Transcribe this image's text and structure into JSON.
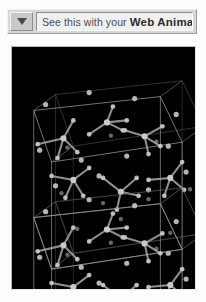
{
  "plugin_bar": {
    "menu_button": {
      "icon": "triangle-down-icon",
      "label": ""
    },
    "message_lead": "See this with your",
    "message_brand": "Web Animator"
  },
  "viewport": {
    "name": "molecule-viewport",
    "background_color": "#000000",
    "render_style": "ball-and-stick",
    "scene_description": "Crystal lattice of two stacked unit cells viewed in perspective, wireframe cell edges with branched tetrahedral molecules and isolated lattice atoms",
    "colors": {
      "atom": "#c9c9c9",
      "atom_dim": "#8a8a8a",
      "bond": "#a8a8a8",
      "cell_edge": "#9a9a9a",
      "cell_edge_back": "#5e5e5e"
    },
    "structure": {
      "cells": 2,
      "cell_stack_axis": "vertical",
      "cell_front_face": [
        [
          22,
          64
        ],
        [
          150,
          50
        ],
        [
          172,
          96
        ],
        [
          40,
          116
        ]
      ],
      "cell_height": 108,
      "perspective_depth": [
        22,
        -16
      ]
    },
    "molecules": [
      {
        "center": [
          52,
          92
        ],
        "type": "tetrahedral",
        "arms": [
          [
            -26,
            6
          ],
          [
            10,
            -18
          ],
          [
            14,
            14
          ],
          [
            -6,
            20
          ]
        ]
      },
      {
        "center": [
          96,
          76
        ],
        "type": "tetrahedral",
        "arms": [
          [
            -18,
            12
          ],
          [
            16,
            8
          ],
          [
            6,
            -16
          ],
          [
            20,
            -2
          ]
        ]
      },
      {
        "center": [
          134,
          90
        ],
        "type": "tetrahedral",
        "arms": [
          [
            -20,
            -6
          ],
          [
            16,
            10
          ],
          [
            4,
            18
          ],
          [
            18,
            -10
          ]
        ]
      },
      {
        "center": [
          62,
          134
        ],
        "type": "tetrahedral",
        "arms": [
          [
            -22,
            -4
          ],
          [
            16,
            -12
          ],
          [
            10,
            16
          ],
          [
            -8,
            18
          ]
        ]
      },
      {
        "center": [
          110,
          146
        ],
        "type": "tetrahedral",
        "arms": [
          [
            -18,
            -14
          ],
          [
            18,
            4
          ],
          [
            -4,
            18
          ],
          [
            16,
            -14
          ]
        ]
      },
      {
        "center": [
          160,
          132
        ],
        "type": "tetrahedral",
        "arms": [
          [
            -22,
            2
          ],
          [
            12,
            -16
          ],
          [
            14,
            12
          ],
          [
            -6,
            18
          ]
        ]
      }
    ],
    "lattice_atoms": [
      [
        34,
        58
      ],
      [
        78,
        46
      ],
      [
        124,
        52
      ],
      [
        166,
        68
      ],
      [
        28,
        104
      ],
      [
        70,
        114
      ],
      [
        116,
        110
      ],
      [
        158,
        100
      ],
      [
        44,
        140
      ],
      [
        88,
        130
      ],
      [
        138,
        144
      ],
      [
        176,
        126
      ]
    ]
  }
}
